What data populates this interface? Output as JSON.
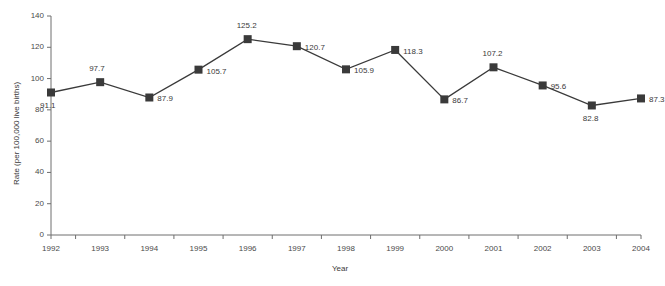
{
  "chart_data": {
    "type": "line",
    "title": "",
    "subtitle": "",
    "xlabel": "Year",
    "ylabel": "Rate (per 100,000 live births)",
    "categories": [
      "1992",
      "1993",
      "1994",
      "1995",
      "1996",
      "1997",
      "1998",
      "1999",
      "2000",
      "2001",
      "2002",
      "2003",
      "2004"
    ],
    "values": [
      91.1,
      97.7,
      87.9,
      105.7,
      125.2,
      120.7,
      105.9,
      118.3,
      86.7,
      107.2,
      95.6,
      82.8,
      87.3
    ],
    "point_labels": [
      "91.1",
      "97.7",
      "87.9",
      "105.7",
      "125.2",
      "120.7",
      "105.9",
      "118.3",
      "86.7",
      "107.2",
      "95.6",
      "82.8",
      "87.3"
    ],
    "label_positions": [
      "below-left",
      "above",
      "right",
      "right",
      "above",
      "right",
      "right",
      "right",
      "right",
      "above",
      "right",
      "below",
      "right"
    ],
    "ylim": [
      0,
      140
    ],
    "yticks": [
      0,
      20,
      40,
      60,
      80,
      100,
      120,
      140
    ],
    "ytick_labels": [
      "0",
      "20",
      "40",
      "60",
      "80",
      "100",
      "120",
      "140"
    ],
    "grid": false,
    "legend": "none",
    "series_color": "#3a3a3a",
    "marker": "square",
    "axis_color": "#6e6e6e"
  }
}
